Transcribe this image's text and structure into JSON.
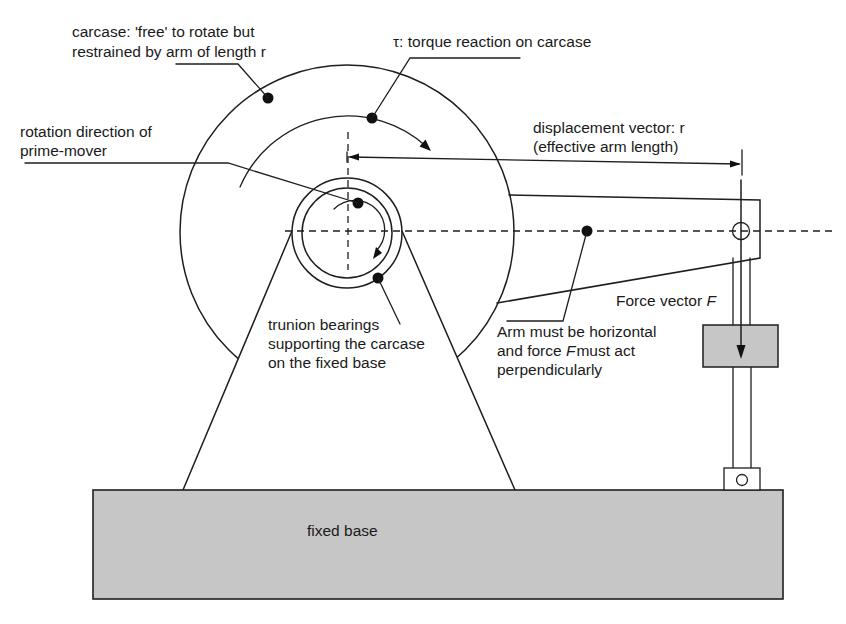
{
  "figure": {
    "labels": {
      "carcase": {
        "line1": "carcase: 'free' to rotate but",
        "line2": "restrained by arm of length r"
      },
      "torque": {
        "line1": "τ: torque reaction on carcase"
      },
      "rotation": {
        "line1": "rotation direction of",
        "line2": "prime-mover"
      },
      "displacement": {
        "line1": "displacement vector: r",
        "line2": "(effective arm length)"
      },
      "bearings": {
        "line1": "trunion bearings",
        "line2": "supporting the carcase",
        "line3": "on the fixed base"
      },
      "arm": {
        "line1": "Arm must be horizontal",
        "line2_pre": "and force ",
        "line2_var": "F",
        "line2_post": "must act",
        "line3": "perpendicularly"
      },
      "force": {
        "pre": "Force vector ",
        "var": "F"
      },
      "base": {
        "text": "fixed base"
      }
    },
    "colors": {
      "line": "#1e1e1e",
      "fill_gray": "#c6c6c6",
      "fill_white": "#ffffff",
      "background": "#ffffff"
    }
  }
}
